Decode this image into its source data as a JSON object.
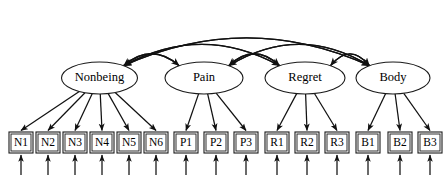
{
  "diagram": {
    "type": "structural-equation-model-path-diagram",
    "canvas": {
      "width": 447,
      "height": 182
    },
    "colors": {
      "stroke": "#111111",
      "shape_outline": "#1a1a1a",
      "background": "#ffffff",
      "text": "#000000"
    },
    "latent_factors": [
      {
        "id": "nonbeing",
        "label": "Nonbeing",
        "cx": 99.5,
        "cy": 78,
        "rx": 38,
        "ry": 16,
        "indicator_ids": [
          "n1",
          "n2",
          "n3",
          "n4",
          "n5",
          "n6"
        ]
      },
      {
        "id": "pain",
        "label": "Pain",
        "cx": 204,
        "cy": 78,
        "rx": 39,
        "ry": 16,
        "indicator_ids": [
          "p1",
          "p2",
          "p3"
        ]
      },
      {
        "id": "regret",
        "label": "Regret",
        "cx": 305,
        "cy": 78,
        "rx": 40,
        "ry": 16,
        "indicator_ids": [
          "r1",
          "r2",
          "r3"
        ]
      },
      {
        "id": "body",
        "label": "Body",
        "cx": 393,
        "cy": 78,
        "rx": 37,
        "ry": 16,
        "indicator_ids": [
          "b1",
          "b2",
          "b3"
        ]
      }
    ],
    "indicators": [
      {
        "id": "n1",
        "label": "N1",
        "x": 9,
        "y": 132,
        "w": 24,
        "h": 21,
        "factor": "nonbeing"
      },
      {
        "id": "n2",
        "label": "N2",
        "x": 36,
        "y": 132,
        "w": 24,
        "h": 21,
        "factor": "nonbeing"
      },
      {
        "id": "n3",
        "label": "N3",
        "x": 63,
        "y": 132,
        "w": 24,
        "h": 21,
        "factor": "nonbeing"
      },
      {
        "id": "n4",
        "label": "N4",
        "x": 90,
        "y": 132,
        "w": 24,
        "h": 21,
        "factor": "nonbeing"
      },
      {
        "id": "n5",
        "label": "N5",
        "x": 117,
        "y": 132,
        "w": 24,
        "h": 21,
        "factor": "nonbeing"
      },
      {
        "id": "n6",
        "label": "N6",
        "x": 144,
        "y": 132,
        "w": 24,
        "h": 21,
        "factor": "nonbeing"
      },
      {
        "id": "p1",
        "label": "P1",
        "x": 174,
        "y": 132,
        "w": 24,
        "h": 21,
        "factor": "pain"
      },
      {
        "id": "p2",
        "label": "P2",
        "x": 204,
        "y": 132,
        "w": 24,
        "h": 21,
        "factor": "pain"
      },
      {
        "id": "p3",
        "label": "P3",
        "x": 234,
        "y": 132,
        "w": 24,
        "h": 21,
        "factor": "pain"
      },
      {
        "id": "r1",
        "label": "R1",
        "x": 265,
        "y": 132,
        "w": 24,
        "h": 21,
        "factor": "regret"
      },
      {
        "id": "r2",
        "label": "R2",
        "x": 295,
        "y": 132,
        "w": 24,
        "h": 21,
        "factor": "regret"
      },
      {
        "id": "r3",
        "label": "R3",
        "x": 325,
        "y": 132,
        "w": 24,
        "h": 21,
        "factor": "regret"
      },
      {
        "id": "b1",
        "label": "B1",
        "x": 356,
        "y": 132,
        "w": 24,
        "h": 21,
        "factor": "body"
      },
      {
        "id": "b2",
        "label": "B2",
        "x": 388,
        "y": 132,
        "w": 24,
        "h": 21,
        "factor": "body"
      },
      {
        "id": "b3",
        "label": "B3",
        "x": 418,
        "y": 132,
        "w": 24,
        "h": 21,
        "factor": "body"
      }
    ],
    "covariances": [
      {
        "id": "cov-nonbeing-pain",
        "from": "nonbeing",
        "to": "pain",
        "arc_height": 36
      },
      {
        "id": "cov-pain-regret",
        "from": "pain",
        "to": "regret",
        "arc_height": 36
      },
      {
        "id": "cov-regret-body",
        "from": "regret",
        "to": "body",
        "arc_height": 36
      },
      {
        "id": "cov-nonbeing-regret",
        "from": "nonbeing",
        "to": "regret",
        "arc_height": 55
      },
      {
        "id": "cov-pain-body",
        "from": "pain",
        "to": "body",
        "arc_height": 55
      },
      {
        "id": "cov-nonbeing-body",
        "from": "nonbeing",
        "to": "body",
        "arc_height": 68
      }
    ],
    "residuals": {
      "length": 22,
      "direction": "upward-into-indicator"
    }
  }
}
